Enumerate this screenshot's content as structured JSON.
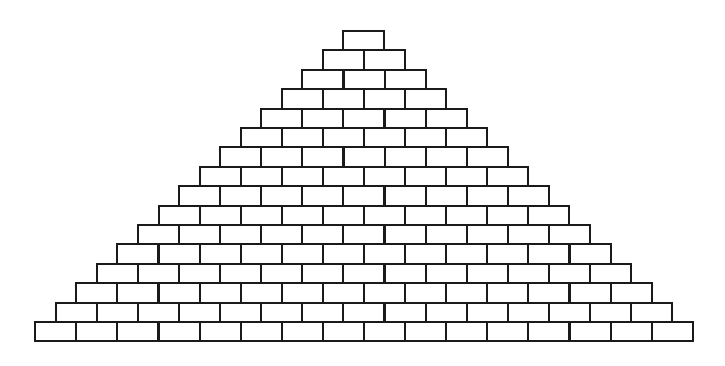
{
  "diagram": {
    "title": "",
    "rows": 16,
    "brick_width": 41.1,
    "brick_height": 19.4,
    "top_y": 30,
    "center_x": 363,
    "colors": {
      "stroke": "#1a1a1a",
      "fill": "#ffffff",
      "background": "#ffffff"
    }
  }
}
